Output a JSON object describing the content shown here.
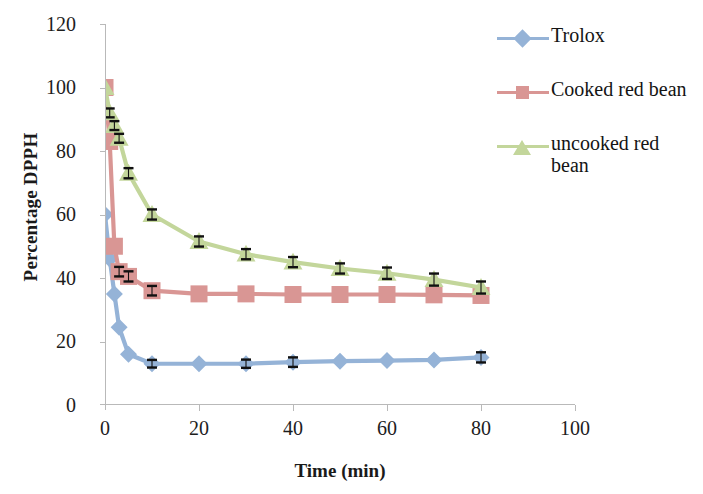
{
  "chart_data": {
    "type": "line",
    "title": "",
    "xlabel": "Time (min)",
    "ylabel": "Percentage DPPH",
    "xlim": [
      0,
      100
    ],
    "ylim": [
      0,
      120
    ],
    "xticks": [
      "0",
      "20",
      "40",
      "60",
      "80",
      "100"
    ],
    "yticks": [
      "0",
      "20",
      "40",
      "60",
      "80",
      "100",
      "120"
    ],
    "grid": false,
    "legend_position": "right",
    "errorbars": true,
    "series": [
      {
        "name": "Trolox",
        "color": "#95b3d7",
        "marker": "diamond",
        "x": [
          0,
          1,
          2,
          3,
          5,
          10,
          20,
          30,
          40,
          50,
          60,
          70,
          80
        ],
        "values": [
          60,
          46,
          35,
          24.5,
          16,
          13,
          13,
          13,
          13.5,
          13.8,
          14,
          14.2,
          15
        ],
        "errors": [
          0,
          0,
          0,
          0,
          0,
          1.2,
          0,
          1.3,
          1.5,
          0,
          0,
          0,
          1.6
        ]
      },
      {
        "name": "Cooked red bean",
        "color": "#d99694",
        "marker": "square",
        "x": [
          0,
          1,
          2,
          3,
          5,
          10,
          20,
          30,
          40,
          50,
          60,
          70,
          80
        ],
        "values": [
          100,
          83,
          50,
          42,
          40.5,
          36,
          35,
          35,
          34.8,
          34.8,
          34.8,
          34.7,
          34.5
        ],
        "errors": [
          0,
          0,
          0,
          1.5,
          1.6,
          1.5,
          0,
          0,
          0,
          0,
          0,
          0,
          0
        ]
      },
      {
        "name": "uncooked red bean",
        "color": "#c3d69b",
        "marker": "triangle",
        "x": [
          0,
          1,
          2,
          3,
          5,
          10,
          20,
          30,
          40,
          50,
          60,
          70,
          80
        ],
        "values": [
          100,
          92,
          88,
          84,
          73,
          60,
          51.5,
          47.5,
          45,
          43,
          41.5,
          39.5,
          37
        ],
        "errors": [
          0,
          1.4,
          1.4,
          1.4,
          1.6,
          1.6,
          1.6,
          1.6,
          1.6,
          1.6,
          1.8,
          1.9,
          1.9
        ]
      }
    ]
  },
  "legend": {
    "items": [
      {
        "label": "Trolox"
      },
      {
        "label": "Cooked red bean"
      },
      {
        "label": "uncooked red bean"
      }
    ]
  },
  "colors": {
    "trolox": "#95b3d7",
    "cooked_red_bean": "#d99694",
    "uncooked_red_bean": "#c3d69b",
    "axis": "#b9b9b9",
    "text": "#1d1d1d",
    "errorbar": "#000000"
  }
}
